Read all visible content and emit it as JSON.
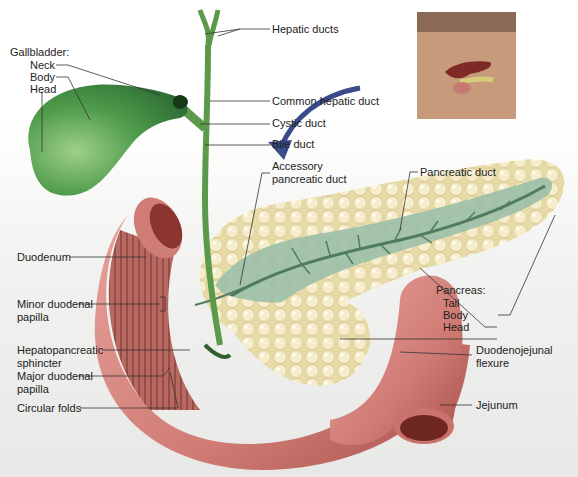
{
  "colors": {
    "gallbladder": "#3e8a42",
    "gallbladder_light": "#8fc67e",
    "duct": "#5a9a4a",
    "duodenum": "#d98a86",
    "duodenum_dark": "#a9443f",
    "duodenum_inner": "#b95a52",
    "pancreas": "#e9ddb0",
    "pancreas_light": "#f7f0d4",
    "pancreas_duct_surface": "#8fb5a0",
    "leader": "#333333",
    "arrow": "#3a4a8a",
    "skin": "#c89a7c"
  },
  "inset": {
    "name": "torso-locator-inset"
  },
  "labels": {
    "gallbladder_title": "Gallbladder:",
    "gallbladder_neck": "Neck",
    "gallbladder_body": "Body",
    "gallbladder_head": "Head",
    "hepatic_ducts": "Hepatic ducts",
    "common_hepatic_duct": "Common hepatic duct",
    "cystic_duct": "Cystic duct",
    "bile_duct": "Bile duct",
    "accessory_pancreatic_duct_1": "Accessory",
    "accessory_pancreatic_duct_2": "pancreatic duct",
    "pancreatic_duct": "Pancreatic duct",
    "duodenum": "Duodenum",
    "minor_duodenal_papilla_1": "Minor duodenal",
    "minor_duodenal_papilla_2": "papilla",
    "hepatopancreatic_sphincter_1": "Hepatopancreatic",
    "hepatopancreatic_sphincter_2": "sphincter",
    "major_duodenal_papilla_1": "Major duodenal",
    "major_duodenal_papilla_2": "papilla",
    "circular_folds": "Circular folds",
    "pancreas_title": "Pancreas:",
    "pancreas_tail": "Tail",
    "pancreas_body": "Body",
    "pancreas_head": "Head",
    "duodenojejunal_flexure_1": "Duodenojejunal",
    "duodenojejunal_flexure_2": "flexure",
    "jejunum": "Jejunum"
  }
}
